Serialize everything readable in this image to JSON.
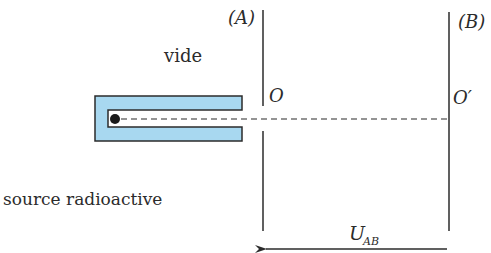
{
  "labels": {
    "plate_a": "(A)",
    "plate_b": "(B)",
    "point_o": "O",
    "point_o_prime": "O′",
    "vacuum": "vide",
    "source": "source radioactive",
    "voltage_main": "U",
    "voltage_sub": "AB"
  },
  "colors": {
    "source_fill": "#a8d8f0",
    "line": "#2b2b2b"
  }
}
